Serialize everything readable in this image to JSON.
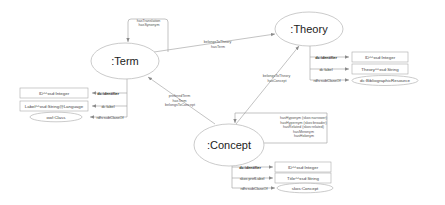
{
  "nodes": {
    "term": {
      "label": ":Term"
    },
    "theory": {
      "label": ":Theory"
    },
    "concept": {
      "label": ":Concept"
    }
  },
  "edges": {
    "term_self": [
      "hasTranslation",
      "hasSynonym"
    ],
    "term_theory": [
      "belongsToTheory",
      "hasTerm"
    ],
    "concept_term": [
      "preferedTerm",
      "hasTerm",
      "belongsToConcept"
    ],
    "concept_theory": [
      "belongsToTheory",
      "hasConcept"
    ],
    "concept_self": [
      "hasHyponym (skos:narrower)",
      "hasHypernym (skos:broader)",
      "hasRelated (skos:related)",
      "hasMeronym",
      "hasHolonym"
    ]
  },
  "term_props": [
    {
      "property": "dc:identifier",
      "value": "ID^^xsd:Integer",
      "shape": "box",
      "bold": true
    },
    {
      "property": "dc:label",
      "value": "Label^^xsd:String@Language",
      "shape": "box",
      "bold": false
    },
    {
      "property": "rdfs:subClassOf",
      "value": "owl:Class",
      "shape": "ellipse",
      "bold": false
    }
  ],
  "theory_props": [
    {
      "property": "dc:identifier",
      "value": "ID^^xsd:Integer",
      "shape": "box",
      "bold": true
    },
    {
      "property": "dc:label",
      "value": "Theory^^xsd:String",
      "shape": "box",
      "bold": false
    },
    {
      "property": "rdfs:subClassOf",
      "value": "dc:BibliographicResource",
      "shape": "ellipse",
      "bold": false
    }
  ],
  "concept_props": [
    {
      "property": "dc:identifier",
      "value": "ID^^xsd:Integer",
      "shape": "box",
      "bold": true
    },
    {
      "property": "skos:prefLabel",
      "value": "Title^^xsd:String",
      "shape": "box",
      "bold": false
    },
    {
      "property": "rdfs:subClassOf",
      "value": "skos:Concept",
      "shape": "ellipse",
      "bold": false
    }
  ]
}
